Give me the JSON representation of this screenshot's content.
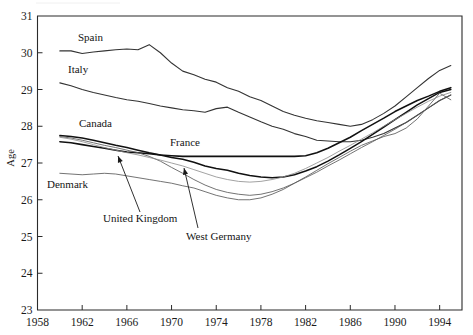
{
  "figure": {
    "axis_titles": {
      "y": "Age",
      "x": ""
    },
    "y_ticks": [
      "23",
      "24",
      "25",
      "26",
      "27",
      "28",
      "29",
      "30",
      "31"
    ],
    "x_ticks": [
      "1958",
      "1962",
      "1966",
      "1970",
      "1974",
      "1978",
      "1982",
      "1986",
      "1990",
      "1994"
    ],
    "labels": {
      "spain": "Spain",
      "italy": "Italy",
      "canada": "Canada",
      "france": "France",
      "denmark": "Denmark",
      "united_kingdom": "United Kingdom",
      "west_germany": "West Germany"
    },
    "colors": {
      "ink": "#111111",
      "axis": "#2b2b2b",
      "faint": "#8a8a8a",
      "background": "#ffffff"
    }
  },
  "chart_data": {
    "type": "line",
    "title": "",
    "subtitle": "",
    "xlabel": "",
    "ylabel": "Age",
    "xlim": [
      1958,
      1996
    ],
    "ylim": [
      23,
      31
    ],
    "grid": false,
    "legend": "inline-labels",
    "x_tick_step": 4,
    "y_tick_step": 1,
    "annotations": [
      {
        "text": "United Kingdom",
        "points_to_series": "United Kingdom",
        "points_to_x": 1965
      },
      {
        "text": "West Germany",
        "points_to_series": "West Germany",
        "points_to_x": 1972
      }
    ],
    "x": [
      1960,
      1961,
      1962,
      1963,
      1964,
      1965,
      1966,
      1967,
      1968,
      1969,
      1970,
      1971,
      1972,
      1973,
      1974,
      1975,
      1976,
      1977,
      1978,
      1979,
      1980,
      1981,
      1982,
      1983,
      1984,
      1985,
      1986,
      1987,
      1988,
      1989,
      1990,
      1991,
      1992,
      1993,
      1994,
      1995
    ],
    "series": [
      {
        "name": "Spain",
        "values": [
          30.05,
          30.05,
          29.98,
          30.02,
          30.05,
          30.08,
          30.1,
          30.08,
          30.22,
          30.0,
          29.72,
          29.5,
          29.4,
          29.28,
          29.2,
          29.05,
          28.95,
          28.8,
          28.7,
          28.55,
          28.4,
          28.3,
          28.22,
          28.15,
          28.1,
          28.05,
          28.0,
          28.05,
          28.18,
          28.35,
          28.55,
          28.8,
          29.05,
          29.3,
          29.52,
          29.65
        ]
      },
      {
        "name": "Italy",
        "values": [
          29.18,
          29.1,
          29.0,
          28.92,
          28.85,
          28.78,
          28.72,
          28.68,
          28.62,
          28.55,
          28.5,
          28.45,
          28.42,
          28.38,
          28.48,
          28.52,
          28.38,
          28.25,
          28.12,
          28.0,
          27.92,
          27.8,
          27.72,
          27.62,
          27.6,
          27.58,
          27.58,
          27.62,
          27.7,
          27.8,
          27.95,
          28.1,
          28.3,
          28.5,
          28.7,
          28.85
        ]
      },
      {
        "name": "Canada",
        "values": [
          27.75,
          27.72,
          27.68,
          27.62,
          27.55,
          27.48,
          27.42,
          27.35,
          27.28,
          27.22,
          27.15,
          27.1,
          27.02,
          26.92,
          26.85,
          26.8,
          26.72,
          26.66,
          26.62,
          26.6,
          26.62,
          26.68,
          26.78,
          26.9,
          27.05,
          27.22,
          27.4,
          27.58,
          27.78,
          27.98,
          28.18,
          28.38,
          28.58,
          28.75,
          28.92,
          29.0
        ]
      },
      {
        "name": "France",
        "values": [
          27.58,
          27.55,
          27.5,
          27.45,
          27.4,
          27.35,
          27.3,
          27.28,
          27.25,
          27.22,
          27.2,
          27.18,
          27.18,
          27.18,
          27.18,
          27.18,
          27.18,
          27.18,
          27.18,
          27.18,
          27.18,
          27.18,
          27.2,
          27.28,
          27.4,
          27.55,
          27.7,
          27.88,
          28.05,
          28.22,
          28.4,
          28.55,
          28.7,
          28.82,
          28.95,
          29.05
        ]
      },
      {
        "name": "Denmark",
        "values": [
          26.72,
          26.7,
          26.68,
          26.7,
          26.72,
          26.7,
          26.65,
          26.6,
          26.55,
          26.5,
          26.45,
          26.38,
          26.32,
          26.22,
          26.12,
          26.05,
          26.0,
          26.0,
          26.05,
          26.15,
          26.28,
          26.45,
          26.62,
          26.8,
          26.98,
          27.15,
          27.32,
          27.48,
          27.6,
          27.72,
          27.8,
          27.95,
          28.2,
          28.55,
          28.9,
          28.72
        ]
      },
      {
        "name": "United Kingdom",
        "values": [
          27.72,
          27.68,
          27.62,
          27.55,
          27.48,
          27.42,
          27.35,
          27.28,
          27.18,
          27.05,
          26.88,
          26.72,
          26.55,
          26.4,
          26.28,
          26.2,
          26.15,
          26.12,
          26.15,
          26.22,
          26.32,
          26.45,
          26.6,
          26.75,
          26.92,
          27.08,
          27.25,
          27.42,
          27.58,
          27.75,
          27.92,
          28.1,
          28.3,
          28.5,
          28.7,
          28.85
        ]
      },
      {
        "name": "West Germany",
        "values": [
          27.7,
          27.65,
          27.58,
          27.5,
          27.42,
          27.35,
          27.28,
          27.22,
          27.15,
          27.08,
          27.0,
          26.92,
          26.82,
          26.72,
          26.62,
          26.55,
          26.5,
          26.48,
          26.5,
          26.55,
          26.62,
          26.72,
          26.85,
          27.0,
          27.15,
          27.32,
          27.48,
          27.65,
          27.82,
          28.0,
          28.18,
          28.35,
          28.52,
          28.68,
          28.82,
          28.92
        ]
      }
    ]
  }
}
